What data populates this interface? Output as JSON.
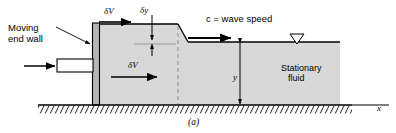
{
  "figure": {
    "caption": "(a)",
    "domain_kind": "fluid-mechanics-schematic"
  },
  "labels": {
    "moving_wall_line1": "Moving",
    "moving_wall_line2": "end wall",
    "delta_v_top": "δV",
    "delta_v_mid": "δV",
    "delta_y": "δy",
    "wave_speed": "c  =  wave speed",
    "depth_y": "y",
    "stationary_line1": "Stationary",
    "stationary_line2": "fluid",
    "axis_x": "x"
  },
  "colors": {
    "fluid_fill": "#d8d8d8",
    "wall_fill": "#b4b4b4",
    "line": "#000000",
    "background": "#ffffff",
    "dashed": "#8a8a8a"
  },
  "geometry": {
    "surface_left_y": 24,
    "surface_right_y": 42,
    "bed_y": 105,
    "wall_x": 93,
    "step_x": 178,
    "fluid_right_x": 340,
    "free_surface_marker_x": 297
  },
  "icons": {
    "free_surface_marker": "inverted-triangle",
    "ground": "hatched-ground-line"
  }
}
